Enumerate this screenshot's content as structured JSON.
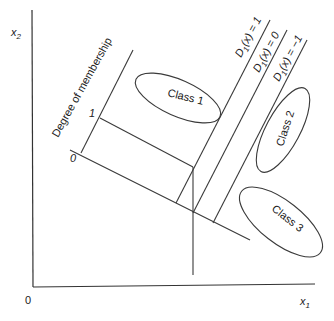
{
  "diagram": {
    "axes": {
      "x_label_main": "x",
      "x_label_sub": "1",
      "y_label_main": "x",
      "y_label_sub": "2",
      "origin_label": "0"
    },
    "membership_axis": {
      "title": "Degree of membership",
      "tick_one": "1",
      "tick_zero": "0"
    },
    "decision_lines": [
      {
        "prefix": "D",
        "sub": "1",
        "rest": "(x) = 1"
      },
      {
        "prefix": "D",
        "sub": "1",
        "rest": "(x) = 0"
      },
      {
        "prefix": "D",
        "sub": "1",
        "rest": "(x) = −1"
      }
    ],
    "classes": [
      {
        "label": "Class 1"
      },
      {
        "label": "Class 2"
      },
      {
        "label": "Class 3"
      }
    ],
    "colors": {
      "line": "#3a3a3a",
      "text": "#222222",
      "background": "#ffffff"
    }
  }
}
